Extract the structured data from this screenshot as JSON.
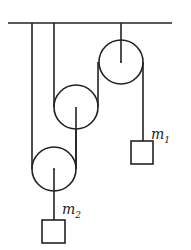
{
  "diagram": {
    "type": "pulley-system",
    "colors": {
      "stroke": "#222222",
      "background": "#ffffff"
    },
    "ceiling": {
      "x1": 8,
      "x2": 172,
      "y": 23
    },
    "pulleys": [
      {
        "id": "top",
        "cx": 121,
        "cy": 62,
        "r": 22,
        "hanger": "ceiling"
      },
      {
        "id": "middle",
        "cx": 76,
        "cy": 107,
        "r": 22
      },
      {
        "id": "bottom",
        "cx": 54,
        "cy": 169,
        "r": 22
      }
    ],
    "masses": [
      {
        "id": "m1",
        "label": "m",
        "subscript": "1",
        "x": 131,
        "y": 141,
        "w": 22,
        "h": 23
      },
      {
        "id": "m2",
        "label": "m",
        "subscript": "2",
        "x": 42,
        "y": 220,
        "w": 23,
        "h": 23
      }
    ]
  }
}
